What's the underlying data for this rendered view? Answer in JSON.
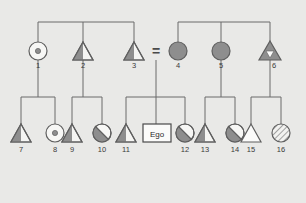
{
  "diagram": {
    "background_color": "#e9e9e7",
    "line_color": "#6b6b6b",
    "fill_shaded": "#8e8e8e",
    "fill_open": "#f2f2f0",
    "label_color": "#3a3a3a",
    "ego_label": "Ego",
    "marriage_symbol": "="
  },
  "generations": [
    {
      "name": "generation-1",
      "persons": [
        {
          "id": "1",
          "label": "1",
          "sex": "female",
          "shape": "circle",
          "fill": "dot-center",
          "x": 38,
          "y": 51
        },
        {
          "id": "2",
          "label": "2",
          "sex": "male",
          "shape": "triangle",
          "fill": "left-shaded",
          "x": 83,
          "y": 51
        },
        {
          "id": "3",
          "label": "3",
          "sex": "male",
          "shape": "triangle",
          "fill": "left-shaded",
          "x": 134,
          "y": 51
        },
        {
          "id": "4",
          "label": "4",
          "sex": "female",
          "shape": "circle",
          "fill": "solid",
          "x": 178,
          "y": 51
        },
        {
          "id": "5",
          "label": "5",
          "sex": "female",
          "shape": "circle",
          "fill": "solid",
          "x": 221,
          "y": 51
        },
        {
          "id": "6",
          "label": "6",
          "sex": "male",
          "shape": "triangle",
          "fill": "solid-inner-open",
          "x": 270,
          "y": 51
        }
      ]
    },
    {
      "name": "generation-2",
      "persons": [
        {
          "id": "7",
          "label": "7",
          "sex": "male",
          "shape": "triangle",
          "fill": "left-shaded",
          "x": 21,
          "y": 133
        },
        {
          "id": "8",
          "label": "8",
          "sex": "female",
          "shape": "circle",
          "fill": "dot-center",
          "x": 55,
          "y": 133
        },
        {
          "id": "9",
          "label": "9",
          "sex": "male",
          "shape": "triangle",
          "fill": "left-shaded",
          "x": 72,
          "y": 133
        },
        {
          "id": "10",
          "label": "10",
          "sex": "female",
          "shape": "circle",
          "fill": "slash-half",
          "x": 102,
          "y": 133
        },
        {
          "id": "11",
          "label": "11",
          "sex": "male",
          "shape": "triangle",
          "fill": "left-shaded",
          "x": 126,
          "y": 133
        },
        {
          "id": "12",
          "label": "12",
          "sex": "female",
          "shape": "circle",
          "fill": "slash-half",
          "x": 185,
          "y": 133
        },
        {
          "id": "13",
          "label": "13",
          "sex": "male",
          "shape": "triangle",
          "fill": "left-shaded",
          "x": 205,
          "y": 133
        },
        {
          "id": "14",
          "label": "14",
          "sex": "female",
          "shape": "circle",
          "fill": "slash-half",
          "x": 235,
          "y": 133
        },
        {
          "id": "15",
          "label": "15",
          "sex": "male",
          "shape": "triangle",
          "fill": "open",
          "x": 251,
          "y": 133
        },
        {
          "id": "16",
          "label": "16",
          "sex": "female",
          "shape": "circle",
          "fill": "hatched",
          "x": 281,
          "y": 133
        }
      ]
    }
  ],
  "ego": {
    "label": "Ego",
    "x": 157,
    "y": 133
  },
  "marriage": {
    "symbol": "=",
    "x": 156,
    "y": 52,
    "between": [
      "3",
      "4"
    ]
  },
  "sibling_groups": [
    {
      "name": "sibship-top-left",
      "members": [
        "1",
        "2",
        "3"
      ]
    },
    {
      "name": "sibship-top-right",
      "members": [
        "4",
        "5",
        "6"
      ]
    },
    {
      "name": "sibship-a",
      "members": [
        "7",
        "8"
      ],
      "parent": "1"
    },
    {
      "name": "sibship-b",
      "members": [
        "9",
        "10"
      ],
      "parent": "2"
    },
    {
      "name": "sibship-c",
      "members": [
        "11",
        "Ego",
        "12"
      ],
      "parent": "3-4"
    },
    {
      "name": "sibship-d",
      "members": [
        "13",
        "14"
      ],
      "parent": "5"
    },
    {
      "name": "sibship-e",
      "members": [
        "15",
        "16"
      ],
      "parent": "6"
    }
  ]
}
